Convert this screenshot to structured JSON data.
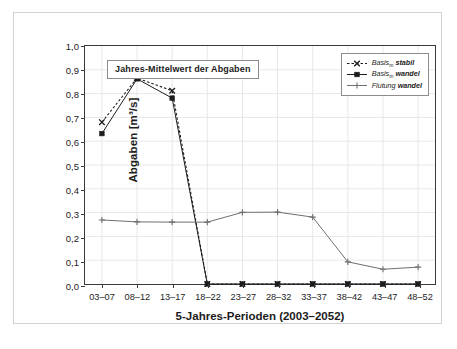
{
  "chart_data": {
    "type": "line",
    "title": "",
    "annotation": "Jahres-Mittelwert der Abgaben",
    "xlabel": "5-Jahres-Perioden (2003–2052)",
    "ylabel": "Abgaben [m³/s]",
    "categories": [
      "03–07",
      "08–12",
      "13–17",
      "18–22",
      "23–27",
      "28–32",
      "33–37",
      "38–42",
      "43–47",
      "48–52"
    ],
    "ylim": [
      0.0,
      1.0
    ],
    "ytick_labels": [
      "0,0",
      "0,1",
      "0,2",
      "0,3",
      "0,4",
      "0,5",
      "0,6",
      "0,7",
      "0,8",
      "0,9",
      "1,0"
    ],
    "ytick_values": [
      0.0,
      0.1,
      0.2,
      0.3,
      0.4,
      0.5,
      0.6,
      0.7,
      0.8,
      0.9,
      1.0
    ],
    "grid": true,
    "legend_position": "top-right",
    "series": [
      {
        "name": "Basis_m stabil",
        "name_main": "Basis",
        "name_sub": "m",
        "name_suffix": "stabil",
        "marker": "x",
        "linestyle": "dashed",
        "color": "#1c1c1c",
        "values": [
          0.68,
          0.865,
          0.812,
          0.0,
          0.0,
          0.0,
          0.0,
          0.0,
          0.0,
          0.0
        ]
      },
      {
        "name": "Basis_m wandel",
        "name_main": "Basis",
        "name_sub": "m",
        "name_suffix": "wandel",
        "marker": "square",
        "linestyle": "solid",
        "color": "#1c1c1c",
        "values": [
          0.632,
          0.862,
          0.781,
          0.0,
          0.0,
          0.0,
          0.0,
          0.0,
          0.0,
          0.0
        ]
      },
      {
        "name": "Flutung wandel",
        "name_main": "Flutung",
        "name_sub": "",
        "name_suffix": "wandel",
        "marker": "plus",
        "linestyle": "solid",
        "color": "#6e6e6e",
        "values": [
          0.269,
          0.261,
          0.26,
          0.26,
          0.301,
          0.302,
          0.281,
          0.093,
          0.062,
          0.071
        ]
      }
    ]
  },
  "legend": {
    "entries": [
      {
        "main": "Basis",
        "sub": "m",
        "suffix": "stabil"
      },
      {
        "main": "Basis",
        "sub": "m",
        "suffix": "wandel"
      },
      {
        "main": "Flutung",
        "sub": "",
        "suffix": "wandel"
      }
    ]
  }
}
